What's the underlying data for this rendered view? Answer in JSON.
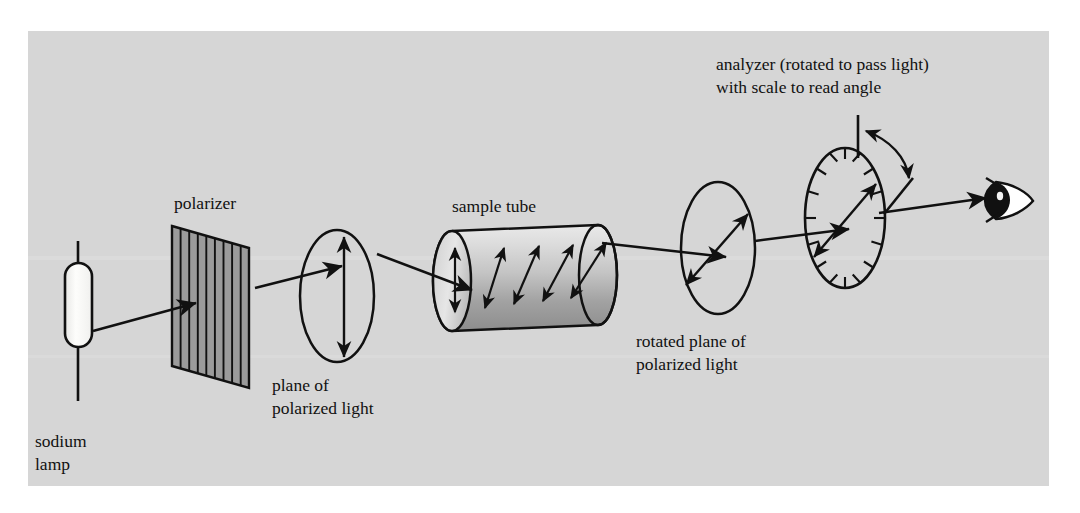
{
  "figure": {
    "title_hidden": "",
    "background_color": "#d6d6d6",
    "page_color": "#ffffff",
    "ink_color": "#111111",
    "labels": {
      "sodium_lamp": [
        "sodium",
        "lamp"
      ],
      "polarizer": "polarizer",
      "plane_of_polarized_light": [
        "plane of",
        "polarized light"
      ],
      "sample_tube": "sample tube",
      "rotated_plane_of_polarized_light": [
        "rotated plane of",
        "polarized light"
      ],
      "analyzer": [
        "analyzer (rotated to pass light)",
        "with scale to read angle"
      ]
    },
    "components": [
      {
        "name": "sodium-lamp",
        "kind": "capsule-lamp",
        "fill": "#fbfbf8",
        "stroke": "#111111",
        "cx": 78,
        "cy": 305,
        "width": 26,
        "height": 84
      },
      {
        "name": "polarizer",
        "kind": "striped-parallelogram",
        "fill": "#9a9a9a",
        "stroke": "#111111",
        "stripe_count": 9,
        "x": 170,
        "y": 220
      },
      {
        "name": "plane-of-polarized-light",
        "kind": "ellipse-with-vertical-double-arrow",
        "cx": 337,
        "cy": 295,
        "rx": 36,
        "ry": 64,
        "arrow_angle_deg": 90
      },
      {
        "name": "sample-tube",
        "kind": "cylinder-with-rotating-arrows",
        "fill_light": "#e3e3e3",
        "fill_dark": "#8e8e8e",
        "arrow_count": 5,
        "arrow_angles_deg": [
          90,
          68,
          58,
          50,
          42
        ],
        "x": 452,
        "y": 228,
        "length": 158,
        "radius_y": 50,
        "radius_x": 18
      },
      {
        "name": "rotated-plane-of-polarized-light",
        "kind": "ellipse-with-tilted-double-arrow",
        "cx": 718,
        "cy": 247,
        "rx": 36,
        "ry": 64,
        "arrow_angle_deg": 42
      },
      {
        "name": "analyzer-disk",
        "kind": "ellipse-with-scale-ticks",
        "cx": 843,
        "cy": 218,
        "rx": 39,
        "ry": 68,
        "tick_count": 16,
        "arrow_angle_deg": 42
      },
      {
        "name": "rotation-angle-indicator",
        "kind": "curved-double-arrow-with-reference-lines",
        "reference_line_angle_deg": 90,
        "measured_line_angle_deg": 42
      },
      {
        "name": "observer-eye",
        "kind": "eye-glyph",
        "cx": 1003,
        "cy": 201
      }
    ],
    "light_beam": {
      "name": "light-beam-path",
      "segments": [
        {
          "from": [
            92,
            330
          ],
          "to": [
            185,
            300
          ],
          "arrowhead": true
        },
        {
          "from": [
            250,
            283
          ],
          "to": [
            340,
            262
          ],
          "arrowhead": true
        },
        {
          "from": [
            377,
            252
          ],
          "to": [
            470,
            295
          ],
          "arrowhead": true
        },
        {
          "from": [
            600,
            243
          ],
          "to": [
            723,
            255
          ],
          "arrowhead": true
        },
        {
          "from": [
            752,
            240
          ],
          "to": [
            846,
            228
          ],
          "arrowhead": true
        },
        {
          "from": [
            878,
            212
          ],
          "to": [
            988,
            196
          ],
          "arrowhead": true
        }
      ]
    }
  }
}
